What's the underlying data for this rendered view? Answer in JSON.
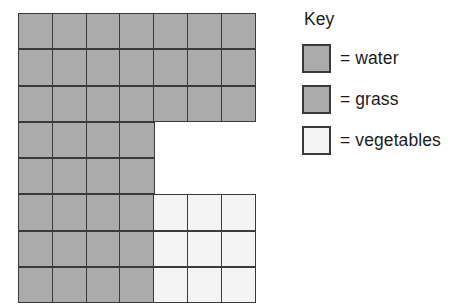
{
  "figure": {
    "type": "grid-map-with-key",
    "background_color": "#ffffff",
    "grid_line_color": "#3a3a3a"
  },
  "key": {
    "title": "Key",
    "entries": [
      {
        "id": "water",
        "swatch_name": "water-swatch",
        "color": "#ababab",
        "label": "= water"
      },
      {
        "id": "grass",
        "swatch_name": "grass-swatch",
        "color": "#ababab",
        "label": "= grass"
      },
      {
        "id": "vegetables",
        "swatch_name": "vegetables-swatch",
        "color": "#f4f4f4",
        "label": "= vegetables"
      }
    ]
  },
  "grid": {
    "columns": 7,
    "rows": 8,
    "cell_width_px": 35.42,
    "cell_height_px": 36.3,
    "legend_colors": {
      "grass": "#ababab",
      "water": "#ababab",
      "vegetables": "#f4f4f4",
      "empty": "transparent"
    },
    "counts": {
      "grass": 37,
      "vegetables": 9,
      "empty": 6,
      "total_filled": 46
    },
    "cells": [
      [
        "grass",
        "grass",
        "grass",
        "grass",
        "grass",
        "grass",
        "grass"
      ],
      [
        "grass",
        "grass",
        "grass",
        "grass",
        "grass",
        "grass",
        "grass"
      ],
      [
        "grass",
        "grass",
        "grass",
        "grass",
        "grass",
        "grass",
        "grass"
      ],
      [
        "grass",
        "grass",
        "grass",
        "grass",
        "empty",
        "empty",
        "empty"
      ],
      [
        "grass",
        "grass",
        "grass",
        "grass",
        "empty",
        "empty",
        "empty"
      ],
      [
        "grass",
        "grass",
        "grass",
        "grass",
        "vegetables",
        "vegetables",
        "vegetables"
      ],
      [
        "grass",
        "grass",
        "grass",
        "grass",
        "vegetables",
        "vegetables",
        "vegetables"
      ],
      [
        "grass",
        "grass",
        "grass",
        "grass",
        "vegetables",
        "vegetables",
        "vegetables"
      ]
    ]
  }
}
